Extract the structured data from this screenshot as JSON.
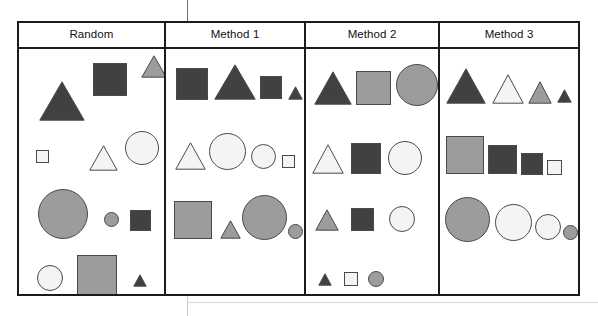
{
  "figure": {
    "name": "shape-comparison-figure",
    "columns": [
      {
        "id": "random",
        "title": "Random"
      },
      {
        "id": "method1",
        "title": "Method 1"
      },
      {
        "id": "method2",
        "title": "Method 2"
      },
      {
        "id": "method3",
        "title": "Method 3"
      }
    ],
    "palette": {
      "dark": "#414141",
      "medium": "#9c9c9c",
      "light": "#f4f4f4",
      "stroke": "#4a4a4a",
      "border": "#1b1b1b",
      "background": "#ffffff"
    },
    "panels": {
      "random": {
        "label": "Random",
        "layout": "unordered",
        "shapes": [
          {
            "type": "triangle",
            "tone": "dark",
            "x": 20,
            "y": 32,
            "w": 46,
            "h": 40
          },
          {
            "type": "square",
            "tone": "dark",
            "x": 74,
            "y": 14,
            "w": 34,
            "h": 33
          },
          {
            "type": "triangle",
            "tone": "medium",
            "x": 122,
            "y": 6,
            "w": 26,
            "h": 23
          },
          {
            "type": "square",
            "tone": "light",
            "x": 17,
            "y": 101,
            "w": 13,
            "h": 13
          },
          {
            "type": "triangle",
            "tone": "light",
            "x": 70,
            "y": 96,
            "w": 29,
            "h": 26
          },
          {
            "type": "circle",
            "tone": "light",
            "x": 106,
            "y": 82,
            "w": 34,
            "h": 34
          },
          {
            "type": "circle",
            "tone": "medium",
            "x": 19,
            "y": 140,
            "w": 50,
            "h": 50
          },
          {
            "type": "circle",
            "tone": "medium",
            "x": 85,
            "y": 163,
            "w": 15,
            "h": 15
          },
          {
            "type": "square",
            "tone": "dark",
            "x": 111,
            "y": 161,
            "w": 21,
            "h": 21
          },
          {
            "type": "circle",
            "tone": "light",
            "x": 18,
            "y": 216,
            "w": 26,
            "h": 26
          },
          {
            "type": "square",
            "tone": "medium",
            "x": 58,
            "y": 206,
            "w": 40,
            "h": 40
          },
          {
            "type": "triangle",
            "tone": "dark",
            "x": 114,
            "y": 225,
            "w": 14,
            "h": 13
          }
        ]
      },
      "method1": {
        "label": "Method 1",
        "layout": "grouped-by-shape-rows",
        "rows": [
          {
            "shape": "square",
            "items": [
              "dark",
              "dark",
              "dark"
            ]
          },
          {
            "shape": "mixed",
            "items": [
              "light",
              "light",
              "light",
              "light"
            ]
          },
          {
            "shape": "mixed",
            "items": [
              "medium",
              "medium",
              "medium",
              "medium"
            ]
          }
        ],
        "shapes": [
          {
            "type": "square",
            "tone": "dark",
            "x": 10,
            "y": 19,
            "w": 32,
            "h": 32
          },
          {
            "type": "triangle",
            "tone": "dark",
            "x": 48,
            "y": 15,
            "w": 42,
            "h": 36
          },
          {
            "type": "square",
            "tone": "dark",
            "x": 94,
            "y": 27,
            "w": 22,
            "h": 23
          },
          {
            "type": "triangle",
            "tone": "dark",
            "x": 122,
            "y": 37,
            "w": 15,
            "h": 14
          },
          {
            "type": "triangle",
            "tone": "light",
            "x": 9,
            "y": 93,
            "w": 31,
            "h": 28
          },
          {
            "type": "circle",
            "tone": "light",
            "x": 43,
            "y": 84,
            "w": 37,
            "h": 37
          },
          {
            "type": "circle",
            "tone": "light",
            "x": 85,
            "y": 95,
            "w": 25,
            "h": 25
          },
          {
            "type": "square",
            "tone": "light",
            "x": 116,
            "y": 106,
            "w": 13,
            "h": 13
          },
          {
            "type": "square",
            "tone": "medium",
            "x": 8,
            "y": 152,
            "w": 38,
            "h": 38
          },
          {
            "type": "triangle",
            "tone": "medium",
            "x": 54,
            "y": 171,
            "w": 21,
            "h": 19
          },
          {
            "type": "circle",
            "tone": "medium",
            "x": 76,
            "y": 146,
            "w": 45,
            "h": 45
          },
          {
            "type": "circle",
            "tone": "medium",
            "x": 122,
            "y": 175,
            "w": 15,
            "h": 15
          }
        ]
      },
      "method2": {
        "label": "Method 2",
        "layout": "grouped-by-size-rows",
        "rows": [
          {
            "size": "large",
            "items": [
              "dark",
              "medium",
              "medium"
            ]
          },
          {
            "size": "medium",
            "items": [
              "light",
              "dark",
              "light"
            ]
          },
          {
            "size": "small",
            "items": [
              "medium",
              "dark",
              "light"
            ]
          },
          {
            "size": "tiny",
            "items": [
              "dark",
              "light",
              "medium"
            ]
          }
        ],
        "shapes": [
          {
            "type": "triangle",
            "tone": "dark",
            "x": 8,
            "y": 22,
            "w": 38,
            "h": 34
          },
          {
            "type": "square",
            "tone": "medium",
            "x": 50,
            "y": 22,
            "w": 35,
            "h": 34
          },
          {
            "type": "circle",
            "tone": "medium",
            "x": 90,
            "y": 15,
            "w": 42,
            "h": 42
          },
          {
            "type": "triangle",
            "tone": "light",
            "x": 6,
            "y": 95,
            "w": 32,
            "h": 30
          },
          {
            "type": "square",
            "tone": "dark",
            "x": 45,
            "y": 94,
            "w": 30,
            "h": 31
          },
          {
            "type": "circle",
            "tone": "light",
            "x": 82,
            "y": 92,
            "w": 34,
            "h": 34
          },
          {
            "type": "triangle",
            "tone": "medium",
            "x": 9,
            "y": 160,
            "w": 24,
            "h": 22
          },
          {
            "type": "square",
            "tone": "dark",
            "x": 45,
            "y": 159,
            "w": 23,
            "h": 23
          },
          {
            "type": "circle",
            "tone": "light",
            "x": 83,
            "y": 157,
            "w": 26,
            "h": 26
          },
          {
            "type": "triangle",
            "tone": "dark",
            "x": 12,
            "y": 224,
            "w": 14,
            "h": 13
          },
          {
            "type": "square",
            "tone": "light",
            "x": 38,
            "y": 223,
            "w": 14,
            "h": 14
          },
          {
            "type": "circle",
            "tone": "medium",
            "x": 62,
            "y": 222,
            "w": 16,
            "h": 16
          }
        ]
      },
      "method3": {
        "label": "Method 3",
        "layout": "grouped-by-shape-and-size",
        "rows": [
          {
            "shape": "triangle",
            "items": [
              "dark",
              "light",
              "medium",
              "dark"
            ]
          },
          {
            "shape": "square",
            "items": [
              "medium",
              "dark",
              "dark",
              "light"
            ]
          },
          {
            "shape": "circle",
            "items": [
              "medium",
              "light",
              "light",
              "medium"
            ]
          }
        ],
        "shapes": [
          {
            "type": "triangle",
            "tone": "dark",
            "x": 6,
            "y": 19,
            "w": 40,
            "h": 36
          },
          {
            "type": "triangle",
            "tone": "light",
            "x": 52,
            "y": 25,
            "w": 32,
            "h": 30
          },
          {
            "type": "triangle",
            "tone": "medium",
            "x": 88,
            "y": 32,
            "w": 24,
            "h": 23
          },
          {
            "type": "triangle",
            "tone": "dark",
            "x": 117,
            "y": 40,
            "w": 15,
            "h": 14
          },
          {
            "type": "square",
            "tone": "medium",
            "x": 6,
            "y": 87,
            "w": 38,
            "h": 38
          },
          {
            "type": "square",
            "tone": "dark",
            "x": 48,
            "y": 96,
            "w": 29,
            "h": 29
          },
          {
            "type": "square",
            "tone": "dark",
            "x": 81,
            "y": 104,
            "w": 22,
            "h": 22
          },
          {
            "type": "square",
            "tone": "light",
            "x": 107,
            "y": 111,
            "w": 15,
            "h": 15
          },
          {
            "type": "circle",
            "tone": "medium",
            "x": 5,
            "y": 148,
            "w": 45,
            "h": 45
          },
          {
            "type": "circle",
            "tone": "light",
            "x": 55,
            "y": 155,
            "w": 37,
            "h": 37
          },
          {
            "type": "circle",
            "tone": "light",
            "x": 95,
            "y": 165,
            "w": 26,
            "h": 26
          },
          {
            "type": "circle",
            "tone": "medium",
            "x": 123,
            "y": 176,
            "w": 15,
            "h": 15
          }
        ]
      }
    }
  }
}
